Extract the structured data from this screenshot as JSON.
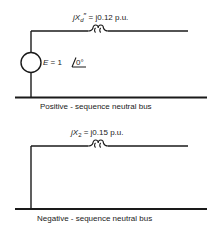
{
  "diagrams": [
    {
      "id": "positive-sequence",
      "reactance_label": {
        "prefix": "j",
        "symbol": "X",
        "subscript": "d",
        "superscript": "″",
        "equals": " = j0.12 p.u."
      },
      "source_label": {
        "symbol": "E",
        "equals": " = 1",
        "angle": "0°"
      },
      "bus_label": "Positive - sequence neutral bus"
    },
    {
      "id": "negative-sequence",
      "reactance_label": {
        "prefix": "j",
        "symbol": "X",
        "subscript": "2",
        "equals": " = j0.15 p.u."
      },
      "bus_label": "Negative - sequence neutral bus"
    }
  ]
}
